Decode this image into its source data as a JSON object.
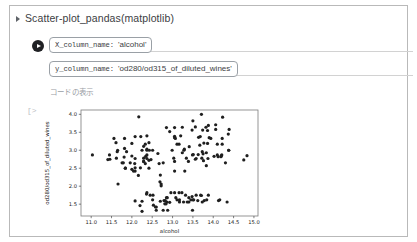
{
  "panel": {
    "title": "Scatter-plot_pandas(matplotlib)",
    "disclosure_icon": "triangle-right-icon",
    "run_icon": "play-circle-icon",
    "show_code_label": "コードの表示",
    "output_prompt": "[>"
  },
  "form": {
    "fields": [
      {
        "key": "X_column_name:",
        "value": "'alcohol'"
      },
      {
        "key": "y_column_name:",
        "value": "'od280/od315_of_diluted_wines'"
      }
    ]
  },
  "chart_data": {
    "type": "scatter",
    "title": "",
    "xlabel": "alcohol",
    "ylabel": "od280/od315_of_diluted_wines",
    "xlim": [
      10.75,
      15.1
    ],
    "ylim": [
      1.17,
      4.12
    ],
    "xticks": [
      "11.0",
      "11.5",
      "12.0",
      "12.5",
      "13.0",
      "13.5",
      "14.0",
      "14.5",
      "15.0"
    ],
    "xtickvals": [
      11.0,
      11.5,
      12.0,
      12.5,
      13.0,
      13.5,
      14.0,
      14.5,
      15.0
    ],
    "yticks": [
      "1.5",
      "2.0",
      "2.5",
      "3.0",
      "3.5",
      "4.0"
    ],
    "ytickvals": [
      1.5,
      2.0,
      2.5,
      3.0,
      3.5,
      4.0
    ],
    "grid": false,
    "legend": null,
    "marker": {
      "color": "#1f1f1f",
      "size": 1.6,
      "shape": "circle"
    },
    "points": [
      [
        14.23,
        3.92
      ],
      [
        13.2,
        3.4
      ],
      [
        13.16,
        3.17
      ],
      [
        14.37,
        3.45
      ],
      [
        13.24,
        2.93
      ],
      [
        14.2,
        2.85
      ],
      [
        14.39,
        3.58
      ],
      [
        14.06,
        3.58
      ],
      [
        14.83,
        2.85
      ],
      [
        13.86,
        3.55
      ],
      [
        14.1,
        3.17
      ],
      [
        14.12,
        2.82
      ],
      [
        13.75,
        2.9
      ],
      [
        14.75,
        2.73
      ],
      [
        14.38,
        3.0
      ],
      [
        13.63,
        2.88
      ],
      [
        14.3,
        2.65
      ],
      [
        13.83,
        2.57
      ],
      [
        14.19,
        2.82
      ],
      [
        13.64,
        3.36
      ],
      [
        14.06,
        3.71
      ],
      [
        12.93,
        3.52
      ],
      [
        13.71,
        4.0
      ],
      [
        12.85,
        3.63
      ],
      [
        13.5,
        3.82
      ],
      [
        13.05,
        2.42
      ],
      [
        13.39,
        2.69
      ],
      [
        13.3,
        2.42
      ],
      [
        13.87,
        2.77
      ],
      [
        14.02,
        2.83
      ],
      [
        13.73,
        2.96
      ],
      [
        13.58,
        2.77
      ],
      [
        13.68,
        3.38
      ],
      [
        13.76,
        2.71
      ],
      [
        13.51,
        2.88
      ],
      [
        13.48,
        3.56
      ],
      [
        13.28,
        3.0
      ],
      [
        13.05,
        3.35
      ],
      [
        13.07,
        3.33
      ],
      [
        14.22,
        3.33
      ],
      [
        13.56,
        2.75
      ],
      [
        13.41,
        3.1
      ],
      [
        13.88,
        3.69
      ],
      [
        13.24,
        3.64
      ],
      [
        13.05,
        3.63
      ],
      [
        14.21,
        2.87
      ],
      [
        14.38,
        3.0
      ],
      [
        13.9,
        3.35
      ],
      [
        14.1,
        2.87
      ],
      [
        13.94,
        3.33
      ],
      [
        13.05,
        3.39
      ],
      [
        13.83,
        2.93
      ],
      [
        13.82,
        3.64
      ],
      [
        13.77,
        3.2
      ],
      [
        13.74,
        3.56
      ],
      [
        13.56,
        3.65
      ],
      [
        14.22,
        3.17
      ],
      [
        13.29,
        3.03
      ],
      [
        13.72,
        2.78
      ],
      [
        12.37,
        1.82
      ],
      [
        12.33,
        3.17
      ],
      [
        12.64,
        2.91
      ],
      [
        13.67,
        3.14
      ],
      [
        12.37,
        3.4
      ],
      [
        12.17,
        3.93
      ],
      [
        12.37,
        3.03
      ],
      [
        13.11,
        3.17
      ],
      [
        12.37,
        2.87
      ],
      [
        13.34,
        2.78
      ],
      [
        12.21,
        2.51
      ],
      [
        12.29,
        2.69
      ],
      [
        13.86,
        3.19
      ],
      [
        13.49,
        2.87
      ],
      [
        12.99,
        3.0
      ],
      [
        11.96,
        2.65
      ],
      [
        11.66,
        2.06
      ],
      [
        13.03,
        2.78
      ],
      [
        11.84,
        2.5
      ],
      [
        12.33,
        2.63
      ],
      [
        12.7,
        2.31
      ],
      [
        12.0,
        2.47
      ],
      [
        12.72,
        2.06
      ],
      [
        12.08,
        1.59
      ],
      [
        13.05,
        1.82
      ],
      [
        11.84,
        2.5
      ],
      [
        12.67,
        2.63
      ],
      [
        12.16,
        2.3
      ],
      [
        11.65,
        3.0
      ],
      [
        11.64,
        2.96
      ],
      [
        12.08,
        2.77
      ],
      [
        12.08,
        3.38
      ],
      [
        12.0,
        2.84
      ],
      [
        12.69,
        2.12
      ],
      [
        12.29,
        2.69
      ],
      [
        11.62,
        2.78
      ],
      [
        12.47,
        2.74
      ],
      [
        11.81,
        2.81
      ],
      [
        12.29,
        3.11
      ],
      [
        12.37,
        3.0
      ],
      [
        12.29,
        2.78
      ],
      [
        12.08,
        2.42
      ],
      [
        12.6,
        1.42
      ],
      [
        12.34,
        2.83
      ],
      [
        11.82,
        3.05
      ],
      [
        12.51,
        3.0
      ],
      [
        12.42,
        2.72
      ],
      [
        12.25,
        3.0
      ],
      [
        12.72,
        2.01
      ],
      [
        12.22,
        3.38
      ],
      [
        11.61,
        3.21
      ],
      [
        11.46,
        2.75
      ],
      [
        12.52,
        1.75
      ],
      [
        11.76,
        2.65
      ],
      [
        11.41,
        2.74
      ],
      [
        12.08,
        2.51
      ],
      [
        11.03,
        2.87
      ],
      [
        11.82,
        3.33
      ],
      [
        12.42,
        3.21
      ],
      [
        12.77,
        2.65
      ],
      [
        12.0,
        3.19
      ],
      [
        11.45,
        2.87
      ],
      [
        11.56,
        3.33
      ],
      [
        12.42,
        2.5
      ],
      [
        13.05,
        2.69
      ],
      [
        11.87,
        2.96
      ],
      [
        12.07,
        2.63
      ],
      [
        12.43,
        3.0
      ],
      [
        11.79,
        2.65
      ],
      [
        12.37,
        2.77
      ],
      [
        12.04,
        2.42
      ],
      [
        12.86,
        1.56
      ],
      [
        12.88,
        1.33
      ],
      [
        12.81,
        1.51
      ],
      [
        12.7,
        1.58
      ],
      [
        12.51,
        1.62
      ],
      [
        12.6,
        1.33
      ],
      [
        12.25,
        1.3
      ],
      [
        12.53,
        1.47
      ],
      [
        13.49,
        1.33
      ],
      [
        12.84,
        1.51
      ],
      [
        12.93,
        1.55
      ],
      [
        13.36,
        1.56
      ],
      [
        13.52,
        1.62
      ],
      [
        13.62,
        1.6
      ],
      [
        12.25,
        1.58
      ],
      [
        13.16,
        1.82
      ],
      [
        13.88,
        1.75
      ],
      [
        12.87,
        1.68
      ],
      [
        13.32,
        1.75
      ],
      [
        13.08,
        1.68
      ],
      [
        13.5,
        1.62
      ],
      [
        12.79,
        1.6
      ],
      [
        13.11,
        1.62
      ],
      [
        13.23,
        1.82
      ],
      [
        12.58,
        1.42
      ],
      [
        13.17,
        1.56
      ],
      [
        13.84,
        1.62
      ],
      [
        12.45,
        1.75
      ],
      [
        14.34,
        1.56
      ],
      [
        13.48,
        1.71
      ],
      [
        12.36,
        1.78
      ],
      [
        13.69,
        1.75
      ],
      [
        12.85,
        1.68
      ],
      [
        12.96,
        1.82
      ],
      [
        13.78,
        1.6
      ],
      [
        13.73,
        1.56
      ],
      [
        13.45,
        1.62
      ],
      [
        12.82,
        1.6
      ],
      [
        13.58,
        1.75
      ],
      [
        13.4,
        1.68
      ],
      [
        12.2,
        1.46
      ],
      [
        12.77,
        1.33
      ],
      [
        14.16,
        1.62
      ],
      [
        13.71,
        1.74
      ],
      [
        13.4,
        1.56
      ],
      [
        13.27,
        1.56
      ],
      [
        13.17,
        1.62
      ],
      [
        14.13,
        1.6
      ]
    ]
  }
}
